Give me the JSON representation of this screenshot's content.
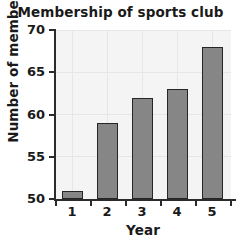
{
  "chart_data": {
    "type": "bar",
    "title": "Membership of sports club",
    "xlabel": "Year",
    "ylabel": "Number of members",
    "categories": [
      "1",
      "2",
      "3",
      "4",
      "5"
    ],
    "values": [
      51,
      59,
      62,
      63,
      68
    ],
    "ylim": [
      50,
      70
    ],
    "yticks": [
      50,
      55,
      60,
      65,
      70
    ],
    "ytick_labels": [
      "50",
      "55",
      "60",
      "65",
      "70"
    ],
    "xtick_labels": [
      "1",
      "2",
      "3",
      "4",
      "5"
    ],
    "grid": true,
    "legend": null,
    "series": [
      {
        "name": "Number of members",
        "values": [
          51,
          59,
          62,
          63,
          68
        ]
      }
    ],
    "colors": {
      "bar_fill": "#868686",
      "bar_edge": "#262626",
      "plot_background": "#f4f4f4",
      "grid_line": "#e6e6e6",
      "axis": "#2b2b2b",
      "text": "#1a1a1a"
    }
  }
}
